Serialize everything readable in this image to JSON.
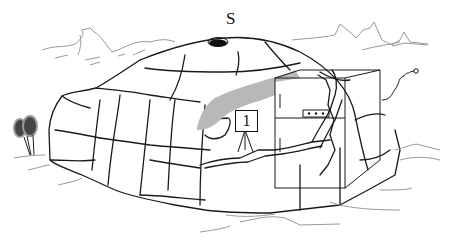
{
  "illustration": {
    "subject": "igloo cross-section with refrigerator",
    "labels": {
      "top_marker": "S",
      "sign_number": "1"
    },
    "colors": {
      "line": "#1a1a1a",
      "shadow_fill": "#b8b8b8",
      "background_lines": "#9a9a9a",
      "background": "#ffffff"
    },
    "elements": [
      "mountains",
      "igloo-dome",
      "vent-hole",
      "refrigerator",
      "power-cord-plug",
      "numbered-sign-on-tripod",
      "snowshoes",
      "snow-ground"
    ]
  }
}
